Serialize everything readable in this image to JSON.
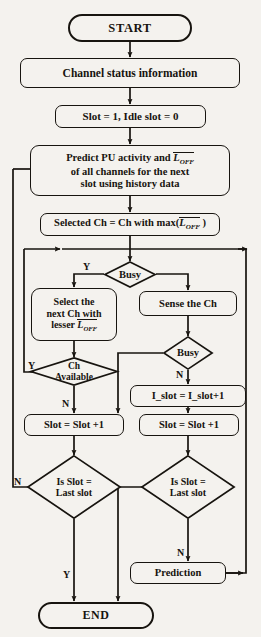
{
  "diagram": {
    "type": "flowchart",
    "background_color": "#f4f2ee",
    "stroke_color": "#17140f"
  },
  "nodes": {
    "start": {
      "label": "START",
      "shape": "terminal"
    },
    "channel_status": {
      "label": "Channel status information",
      "shape": "process"
    },
    "init_slot": {
      "label": "Slot = 1, Idle slot = 0",
      "shape": "process"
    },
    "predict": {
      "line1_pre": "Predict PU activity and ",
      "line1_sym": "L",
      "line1_sub": "OFF",
      "line2": "of all channels for the next",
      "line3": "slot using history data",
      "shape": "process"
    },
    "selected_ch": {
      "pre": "Selected Ch = Ch with max(",
      "sym": "L",
      "sub": "OFF",
      "post": " )",
      "shape": "process"
    },
    "busy_top": {
      "label": "Busy",
      "shape": "decision"
    },
    "select_next": {
      "line1": "Select the",
      "line2": "next Ch with",
      "line3_pre": "lesser ",
      "line3_sym": "L",
      "line3_sub": "OFF",
      "shape": "process"
    },
    "sense_ch": {
      "label": "Sense the Ch",
      "shape": "process"
    },
    "busy_right": {
      "label": "Busy",
      "shape": "decision"
    },
    "ch_available": {
      "line1": "Ch",
      "line2": "Available",
      "shape": "decision"
    },
    "i_slot_inc": {
      "label": "I_slot = I_slot+1",
      "shape": "process"
    },
    "slot_inc_left": {
      "label": "Slot = Slot +1",
      "shape": "process"
    },
    "slot_inc_right": {
      "label": "Slot = Slot +1",
      "shape": "process"
    },
    "is_last_slot_left": {
      "line1": "Is Slot =",
      "line2": "Last slot",
      "shape": "decision"
    },
    "is_last_slot_right": {
      "line1": "Is Slot =",
      "line2": "Last slot",
      "shape": "decision"
    },
    "prediction": {
      "label": "Prediction",
      "shape": "process"
    },
    "end": {
      "label": "END",
      "shape": "terminal"
    }
  },
  "edge_labels": {
    "busy_top_yes": "Y",
    "busy_right_no": "N",
    "ch_available_yes": "Y",
    "ch_available_no": "N",
    "is_last_slot_left_no": "N",
    "is_last_slot_left_yes": "Y",
    "is_last_slot_right_no": "N"
  }
}
